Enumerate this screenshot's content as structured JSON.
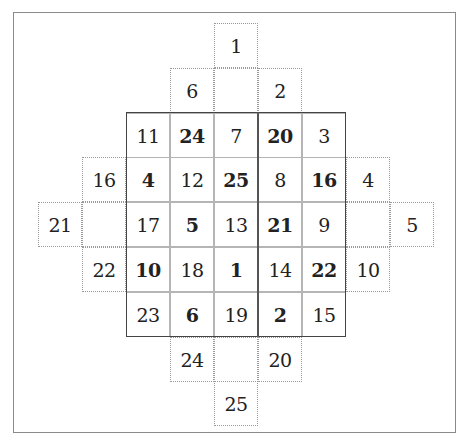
{
  "diagram": {
    "title": "",
    "grid": {
      "rows": [
        [
          {
            "v": "11",
            "b": false
          },
          {
            "v": "24",
            "b": true
          },
          {
            "v": "7",
            "b": false
          },
          {
            "v": "20",
            "b": true
          },
          {
            "v": "3",
            "b": false
          }
        ],
        [
          {
            "v": "4",
            "b": true
          },
          {
            "v": "12",
            "b": false
          },
          {
            "v": "25",
            "b": true
          },
          {
            "v": "8",
            "b": false
          },
          {
            "v": "16",
            "b": true
          }
        ],
        [
          {
            "v": "17",
            "b": false
          },
          {
            "v": "5",
            "b": true
          },
          {
            "v": "13",
            "b": false
          },
          {
            "v": "21",
            "b": true
          },
          {
            "v": "9",
            "b": false
          }
        ],
        [
          {
            "v": "10",
            "b": true
          },
          {
            "v": "18",
            "b": false
          },
          {
            "v": "1",
            "b": true
          },
          {
            "v": "14",
            "b": false
          },
          {
            "v": "22",
            "b": true
          }
        ],
        [
          {
            "v": "23",
            "b": false
          },
          {
            "v": "6",
            "b": true
          },
          {
            "v": "19",
            "b": false
          },
          {
            "v": "2",
            "b": true
          },
          {
            "v": "15",
            "b": false
          }
        ]
      ]
    },
    "outer_cells": [
      {
        "row": 0,
        "col": 4,
        "v": "1"
      },
      {
        "row": 1,
        "col": 3,
        "v": "6"
      },
      {
        "row": 1,
        "col": 4,
        "v": ""
      },
      {
        "row": 1,
        "col": 5,
        "v": "2"
      },
      {
        "row": 3,
        "col": 1,
        "v": "16"
      },
      {
        "row": 3,
        "col": 7,
        "v": "4"
      },
      {
        "row": 4,
        "col": 0,
        "v": "21"
      },
      {
        "row": 4,
        "col": 1,
        "v": ""
      },
      {
        "row": 4,
        "col": 7,
        "v": ""
      },
      {
        "row": 4,
        "col": 8,
        "v": "5"
      },
      {
        "row": 5,
        "col": 1,
        "v": "22"
      },
      {
        "row": 5,
        "col": 7,
        "v": "10"
      },
      {
        "row": 7,
        "col": 3,
        "v": "24"
      },
      {
        "row": 7,
        "col": 4,
        "v": ""
      },
      {
        "row": 7,
        "col": 5,
        "v": "20"
      },
      {
        "row": 8,
        "col": 4,
        "v": "25"
      }
    ]
  }
}
